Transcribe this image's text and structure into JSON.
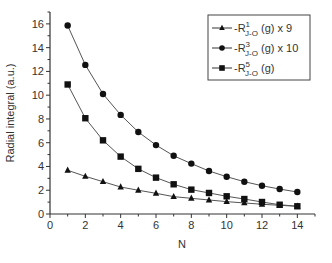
{
  "chart_data": {
    "type": "line",
    "title": "",
    "xlabel": "N",
    "ylabel": "Radial integral (a.u.)",
    "xlim": [
      0,
      15
    ],
    "ylim": [
      0,
      17
    ],
    "xticks": [
      0,
      2,
      4,
      6,
      8,
      10,
      12,
      14
    ],
    "yticks": [
      0,
      2,
      4,
      6,
      8,
      10,
      12,
      14,
      16
    ],
    "grid": false,
    "legend_position": "upper right",
    "x": [
      1,
      2,
      3,
      4,
      5,
      6,
      7,
      8,
      9,
      10,
      11,
      12,
      13,
      14
    ],
    "series": [
      {
        "name": "-R^1_{J-O} (g) x 9",
        "legend": {
          "prefix": "-R",
          "sup": "1",
          "sub": "J-O",
          "suffix": " (g) x 9"
        },
        "marker": "triangle",
        "values": [
          3.68,
          3.17,
          2.72,
          2.27,
          2.0,
          1.74,
          1.46,
          1.32,
          1.18,
          1.04,
          0.93,
          0.82,
          0.73,
          0.65
        ]
      },
      {
        "name": "-R^3_{J-O} (g) x 10",
        "legend": {
          "prefix": "-R",
          "sup": "3",
          "sub": "J-O",
          "suffix": " (g) x 10"
        },
        "marker": "circle",
        "values": [
          15.86,
          12.55,
          10.1,
          8.34,
          6.9,
          5.8,
          4.9,
          4.24,
          3.62,
          3.14,
          2.72,
          2.38,
          2.1,
          1.85
        ]
      },
      {
        "name": "-R^5_{J-O} (g)",
        "legend": {
          "prefix": "-R",
          "sup": "5",
          "sub": "J-O",
          "suffix": " (g)"
        },
        "marker": "square",
        "values": [
          10.9,
          8.06,
          6.2,
          4.83,
          3.8,
          3.06,
          2.5,
          2.05,
          1.77,
          1.49,
          1.26,
          1.01,
          0.78,
          0.65
        ]
      }
    ]
  }
}
